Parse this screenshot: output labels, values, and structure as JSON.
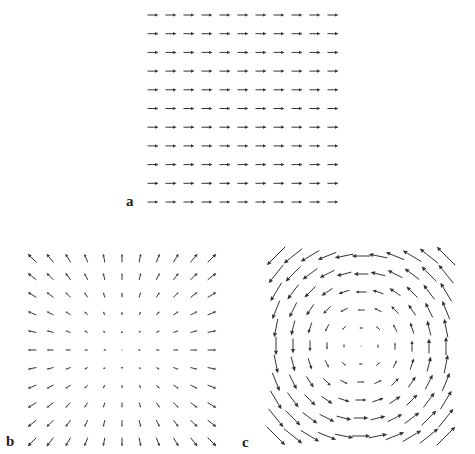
{
  "figure": {
    "width": 475,
    "height": 454,
    "arrow_color": "#333333",
    "background": "#ffffff"
  },
  "panels": [
    {
      "label": "a",
      "label_pos": [
        126,
        194
      ],
      "field_type": "uniform",
      "description": "Uniform vector field pointing right",
      "grid": {
        "cols": 11,
        "rows": 11,
        "x0": 153,
        "y0": 15,
        "dx": 18,
        "dy": 18.7
      },
      "vector": [
        1,
        0
      ],
      "arrow_length_px": 11
    },
    {
      "label": "b",
      "label_pos": [
        6,
        434
      ],
      "field_type": "radial-source",
      "description": "Radial field pointing outward from center, magnitude proportional to distance",
      "grid": {
        "cols": 11,
        "rows": 11,
        "x0": 32,
        "y0": 258,
        "dx": 18,
        "dy": 18.4
      },
      "center_index": [
        5,
        5
      ],
      "scale_px_per_unit": 1.75
    },
    {
      "label": "c",
      "label_pos": [
        242,
        435
      ],
      "field_type": "rotation-ccw",
      "description": "Counter-clockwise rotational field around center, magnitude proportional to distance",
      "grid": {
        "cols": 11,
        "rows": 11,
        "x0": 276,
        "y0": 256,
        "dx": 17,
        "dy": 18
      },
      "center_index": [
        5,
        5
      ],
      "scale_px_per_unit": 3.7
    }
  ]
}
